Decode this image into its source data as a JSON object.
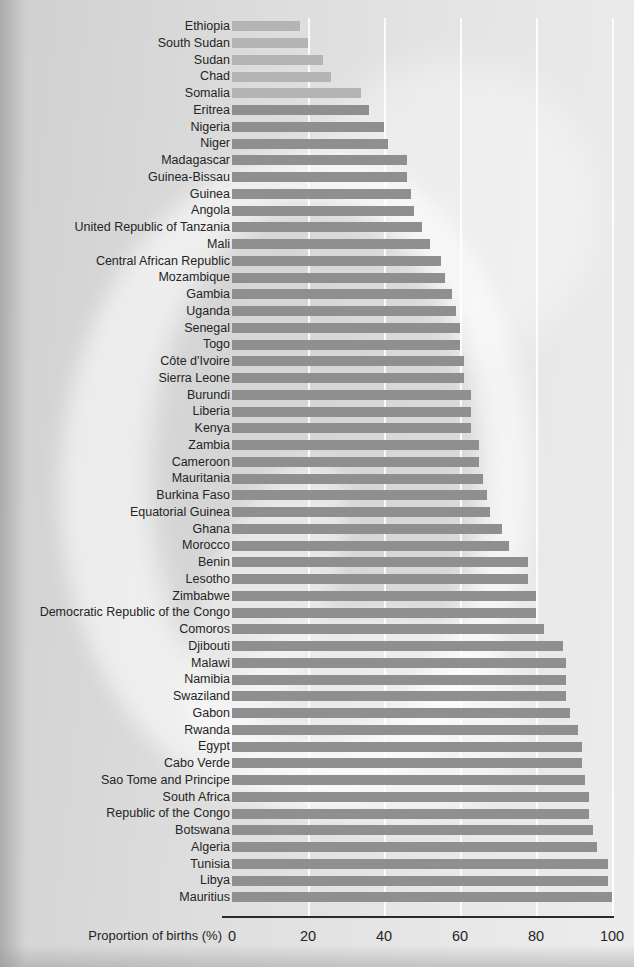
{
  "chart_data": {
    "type": "bar",
    "orientation": "horizontal",
    "title": "",
    "xlabel": "Proportion of births (%)",
    "ylabel": "",
    "xlim": [
      0,
      100
    ],
    "xticks": [
      0,
      20,
      40,
      60,
      80,
      100
    ],
    "xtick_labels": [
      "0",
      "20",
      "40",
      "60",
      "80",
      "100"
    ],
    "grid": true,
    "grid_axis": "x",
    "legend": "none",
    "bar_color": "#8f8f8f",
    "bar_color_light": "#b4b4b4",
    "categories": [
      "Ethiopia",
      "South Sudan",
      "Sudan",
      "Chad",
      "Somalia",
      "Eritrea",
      "Nigeria",
      "Niger",
      "Madagascar",
      "Guinea-Bissau",
      "Guinea",
      "Angola",
      "United Republic of Tanzania",
      "Mali",
      "Central African Republic",
      "Mozambique",
      "Gambia",
      "Uganda",
      "Senegal",
      "Togo",
      "Côte d'Ivoire",
      "Sierra Leone",
      "Burundi",
      "Liberia",
      "Kenya",
      "Zambia",
      "Cameroon",
      "Mauritania",
      "Burkina Faso",
      "Equatorial Guinea",
      "Ghana",
      "Morocco",
      "Benin",
      "Lesotho",
      "Zimbabwe",
      "Democratic Republic of the Congo",
      "Comoros",
      "Djibouti",
      "Malawi",
      "Namibia",
      "Swaziland",
      "Gabon",
      "Rwanda",
      "Egypt",
      "Cabo Verde",
      "Sao Tome and Principe",
      "South Africa",
      "Republic of the Congo",
      "Botswana",
      "Algeria",
      "Tunisia",
      "Libya",
      "Mauritius"
    ],
    "values": [
      18,
      20,
      24,
      26,
      34,
      36,
      40,
      41,
      46,
      46,
      47,
      48,
      50,
      52,
      55,
      56,
      58,
      59,
      60,
      60,
      61,
      61,
      63,
      63,
      63,
      65,
      65,
      66,
      67,
      68,
      71,
      73,
      78,
      78,
      80,
      80,
      82,
      87,
      88,
      88,
      88,
      89,
      91,
      92,
      92,
      93,
      94,
      94,
      95,
      96,
      99,
      99,
      100
    ],
    "light_bars": [
      0,
      1,
      2,
      3,
      4
    ]
  },
  "axis": {
    "title": "Proportion of births (%)"
  }
}
